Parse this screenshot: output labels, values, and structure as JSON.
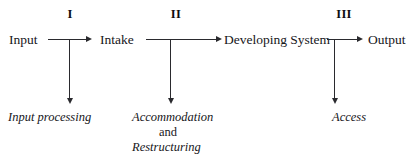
{
  "diagram": {
    "line_color": "#2a2a2e",
    "text_color": "#16161a",
    "background": "#ffffff",
    "stages": [
      {
        "numeral": "I",
        "x": 70,
        "y": 8
      },
      {
        "numeral": "II",
        "x": 176,
        "y": 8
      },
      {
        "numeral": "III",
        "x": 344,
        "y": 8
      }
    ],
    "nodes": [
      {
        "id": "input",
        "label": "Input",
        "x": 9,
        "y": 33
      },
      {
        "id": "intake",
        "label": "Intake",
        "x": 100,
        "y": 33
      },
      {
        "id": "developing-system",
        "label": "Developing System",
        "x": 224,
        "y": 33
      },
      {
        "id": "output",
        "label": "Output",
        "x": 368,
        "y": 33
      }
    ],
    "sublabels": [
      {
        "id": "input-processing",
        "lines": [
          {
            "text": "Input processing",
            "style": "italic",
            "x": 8,
            "y": 111,
            "align": "left"
          }
        ]
      },
      {
        "id": "accommodation-and-restructuring",
        "lines": [
          {
            "text": "Accommodation",
            "style": "italic",
            "x": 132,
            "y": 111,
            "align": "left"
          },
          {
            "text": "and",
            "style": "roman",
            "x": 168,
            "y": 126,
            "align": "center"
          },
          {
            "text": "Restructuring",
            "style": "italic",
            "x": 132,
            "y": 141,
            "align": "left"
          }
        ]
      },
      {
        "id": "access",
        "lines": [
          {
            "text": "Access",
            "style": "italic",
            "x": 332,
            "y": 111,
            "align": "left"
          }
        ]
      }
    ],
    "connectors": {
      "horizontal": [
        {
          "id": "input-to-intake",
          "x": 48,
          "y": 39,
          "length": 38
        },
        {
          "id": "intake-to-developing-system",
          "x": 146,
          "y": 39,
          "length": 70
        },
        {
          "id": "developing-system-to-output",
          "x": 327,
          "y": 39,
          "length": 30
        }
      ],
      "horizontal_arrowheads": [
        {
          "id": "arrowhead-intake",
          "x": 86,
          "y": 36
        },
        {
          "id": "arrowhead-developing-system",
          "x": 216,
          "y": 36
        },
        {
          "id": "arrowhead-output",
          "x": 357,
          "y": 36
        }
      ],
      "vertical": [
        {
          "id": "branch-input-processing",
          "x": 69,
          "y": 40,
          "length": 58
        },
        {
          "id": "branch-accommodation",
          "x": 170,
          "y": 40,
          "length": 58
        },
        {
          "id": "branch-access",
          "x": 334,
          "y": 40,
          "length": 58
        }
      ],
      "vertical_arrowheads": [
        {
          "id": "arrowhead-input-processing",
          "x": 69,
          "y": 98
        },
        {
          "id": "arrowhead-accommodation",
          "x": 170,
          "y": 98
        },
        {
          "id": "arrowhead-access",
          "x": 334,
          "y": 98
        }
      ]
    }
  }
}
